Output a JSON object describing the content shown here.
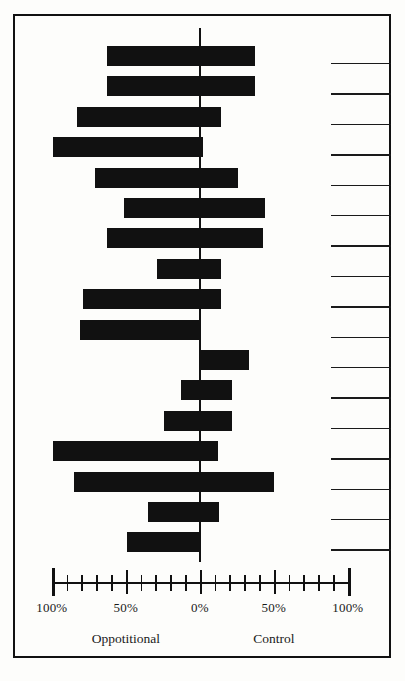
{
  "chart_data": {
    "type": "bar",
    "orientation": "horizontal-diverging",
    "title": "",
    "subtitle": "",
    "xlabel": "",
    "ylabel": "",
    "grid": false,
    "legend_position": "none",
    "xlim": [
      -100,
      100
    ],
    "x_axis": {
      "center_value": 0,
      "left_max": 100,
      "right_max": 100,
      "unit": "%",
      "major_ticks": [
        -100,
        -50,
        0,
        50,
        100
      ],
      "major_tick_labels": [
        "100%",
        "50%",
        "0%",
        "50%",
        "100%"
      ],
      "minor_tick_step": 10
    },
    "group_labels": [
      {
        "name": "left-group",
        "text": "Oppotitional",
        "value_at": -50
      },
      {
        "name": "right-group",
        "text": "Control",
        "value_at": 50
      }
    ],
    "series": [
      {
        "name": "Oppotitional",
        "side": "left",
        "values": [
          63,
          63,
          83,
          99,
          71,
          51,
          63,
          29,
          79,
          81,
          0,
          13,
          24,
          99,
          85,
          35,
          49
        ]
      },
      {
        "name": "Control",
        "side": "right",
        "values": [
          37,
          37,
          14,
          2,
          26,
          44,
          43,
          14,
          14,
          0,
          33,
          22,
          22,
          12,
          50,
          13,
          0
        ]
      }
    ],
    "row_count": 17,
    "row_label_rules": 17,
    "bar_color": "#111111",
    "background_color": "#fdfdfb",
    "frame_color": "#111111"
  }
}
